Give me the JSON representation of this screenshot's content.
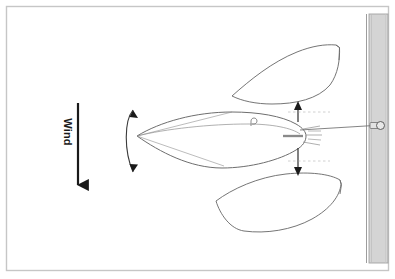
{
  "figure": {
    "background_color": "#ffffff",
    "border_color": "#c8c8c8",
    "stroke_color": "#6e6e6e",
    "arrow_color": "#1a1a1a",
    "dock_fill": "#d2d2d2",
    "dock_edge_color": "#9a9a9a",
    "width": 395,
    "height": 279
  },
  "labels": {
    "wind": "Wind"
  },
  "annotations": {
    "wind_arrow": {
      "name": "wind-direction-arrow",
      "direction": "down",
      "x": 78,
      "y_start": 103,
      "y_end": 192
    },
    "bow_swing_arc": {
      "name": "bow-swing-arc",
      "double_headed": true,
      "center_x": 133,
      "top_y": 104,
      "bottom_y": 178
    },
    "stern_swing_up_arrow": {
      "name": "stern-swing-up-arrow",
      "direction": "up",
      "x": 298,
      "y_start": 122,
      "y_end": 101
    },
    "stern_swing_down_arrow": {
      "name": "stern-swing-down-arrow",
      "direction": "down",
      "x": 298,
      "y_start": 148,
      "y_end": 175
    }
  },
  "objects": {
    "dock": {
      "name": "dock",
      "x": 369,
      "y": 14,
      "width": 19,
      "height": 249
    },
    "mooring_ring": {
      "name": "mooring-ring",
      "x": 378,
      "y": 125
    },
    "mooring_line": {
      "name": "mooring-line",
      "from_x": 302,
      "from_y": 131,
      "to_x": 374,
      "to_y": 125
    },
    "boat_center": {
      "name": "boat-hull-center",
      "heading": "bow-left",
      "bow_x": 137,
      "stern_x": 306,
      "center_y": 136
    },
    "boat_upper": {
      "name": "boat-hull-swung-upwind",
      "heading": "bow-left-up",
      "bow_x": 232,
      "stern_x": 338,
      "center_y": 75
    },
    "boat_lower": {
      "name": "boat-hull-swung-downwind",
      "heading": "bow-left-down",
      "bow_x": 216,
      "stern_x": 340,
      "center_y": 202
    },
    "deck_cleat": {
      "name": "deck-cleat",
      "x": 253,
      "y": 122
    }
  }
}
